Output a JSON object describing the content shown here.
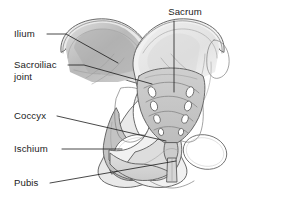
{
  "figure": {
    "background_color": "#ffffff",
    "width": 285,
    "height": 201
  },
  "labels": [
    {
      "id": "ilium",
      "text": "Ilium",
      "text_x": 14,
      "text_y": 37,
      "anchor": "start",
      "leader_path": "M 47 34 L 66 34 L 118 63",
      "points_to": "left iliac fossa"
    },
    {
      "id": "sacroiliac-joint",
      "text": "Sacroiliac",
      "text_x": 14,
      "text_y": 68,
      "anchor": "start",
      "leader_path": "M 68 65 L 84 65 L 152 84",
      "points_to": "left sacroiliac joint"
    },
    {
      "id": "sacroiliac-joint-line2",
      "text": "joint",
      "text_x": 14,
      "text_y": 80,
      "anchor": "start",
      "leader_path": "",
      "points_to": ""
    },
    {
      "id": "sacrum",
      "text": "Sacrum",
      "text_x": 185,
      "text_y": 15,
      "anchor": "middle",
      "leader_path": "M 174 21 L 174 92",
      "points_to": "sacrum body"
    },
    {
      "id": "coccyx",
      "text": "Coccyx",
      "text_x": 14,
      "text_y": 119,
      "anchor": "start",
      "leader_path": "M 57 116 L 166 141",
      "points_to": "coccyx"
    },
    {
      "id": "ischium",
      "text": "Ischium",
      "text_x": 14,
      "text_y": 152,
      "anchor": "start",
      "leader_path": "M 62 149 L 122 149",
      "points_to": "left ischium"
    },
    {
      "id": "pubis",
      "text": "Pubis",
      "text_x": 14,
      "text_y": 186,
      "anchor": "start",
      "leader_path": "M 50 183 L 176 161",
      "points_to": "pubic symphysis"
    }
  ],
  "structures": [
    {
      "id": "left-ilium",
      "name": "Ilium (left)",
      "fill": "#b4b4b4"
    },
    {
      "id": "right-ilium",
      "name": "Ilium (right)",
      "fill": "#e8e8e8"
    },
    {
      "id": "sacrum",
      "name": "Sacrum",
      "fill": "#c4c4c4"
    },
    {
      "id": "coccyx",
      "name": "Coccyx",
      "fill": "#c9c9c9"
    },
    {
      "id": "left-ischium",
      "name": "Ischium (left)",
      "fill": "#c0c0c0"
    },
    {
      "id": "right-ischium",
      "name": "Ischium (right)",
      "fill": "#dedede"
    },
    {
      "id": "pubis",
      "name": "Pubis",
      "fill": "#d4d4d4"
    },
    {
      "id": "obturator-foramen-left",
      "name": "Obturator foramen (left)",
      "fill": "#ffffff"
    },
    {
      "id": "obturator-foramen-right",
      "name": "Obturator foramen (right)",
      "fill": "#ffffff"
    },
    {
      "id": "sacral-foramina",
      "name": "Sacral foramina",
      "fill": "#ffffff",
      "count": 8
    }
  ],
  "colors": {
    "outline": "#5a5a5a",
    "inner_line": "#7d7d7d",
    "faint_line": "#9b9b9b",
    "leader_line": "#1b1b1b",
    "text": "#1b1b1b",
    "shade_dark": "#b4b4b4",
    "shade_mid": "#c9c9c9",
    "shade_light": "#e4e4e4",
    "shade_pale": "#f0f0f0"
  }
}
